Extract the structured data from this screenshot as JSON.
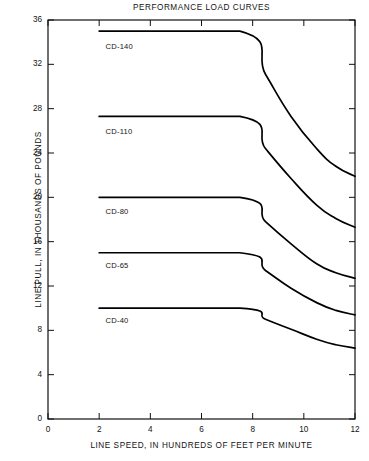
{
  "chart_data": {
    "type": "line",
    "title": "PERFORMANCE LOAD CURVES",
    "xlabel": "LINE SPEED, IN HUNDREDS OF FEET PER MINUTE",
    "ylabel": "LINE PULL, IN THOUSANDS OF POUNDS",
    "xlim": [
      0,
      12
    ],
    "ylim": [
      0,
      36
    ],
    "xticks": [
      0,
      2,
      4,
      6,
      8,
      10,
      12
    ],
    "yticks": [
      0,
      4,
      8,
      12,
      16,
      20,
      24,
      28,
      32,
      36
    ],
    "xtick_labels": [
      "0",
      "2",
      "4",
      "6",
      "8",
      "10",
      "12"
    ],
    "ytick_labels": [
      "0",
      "4",
      "8",
      "12",
      "16",
      "20",
      "24",
      "28",
      "32",
      "36"
    ],
    "grid": false,
    "legend_position": "inline-labels",
    "line_color": "#000000",
    "series": [
      {
        "name": "CD-140",
        "label": "CD-140",
        "label_x": 2.25,
        "label_y": 33.6,
        "x": [
          2.0,
          7.5,
          8.5,
          9.5,
          10.5,
          11.25,
          12.0
        ],
        "y": [
          35.0,
          35.0,
          31.1,
          27.3,
          24.4,
          22.8,
          21.9
        ]
      },
      {
        "name": "CD-110",
        "label": "CD-110",
        "label_x": 2.25,
        "label_y": 25.9,
        "x": [
          2.0,
          7.5,
          8.5,
          9.5,
          10.5,
          11.25,
          12.0
        ],
        "y": [
          27.3,
          27.3,
          24.4,
          21.7,
          19.3,
          18.1,
          17.3
        ]
      },
      {
        "name": "CD-80",
        "label": "CD-80",
        "label_x": 2.25,
        "label_y": 18.7,
        "x": [
          2.0,
          7.5,
          8.5,
          9.5,
          10.5,
          11.25,
          12.0
        ],
        "y": [
          20.0,
          20.0,
          17.8,
          15.8,
          14.0,
          13.2,
          12.7
        ]
      },
      {
        "name": "CD-65",
        "label": "CD-65",
        "label_x": 2.25,
        "label_y": 13.8,
        "x": [
          2.0,
          7.5,
          8.5,
          9.5,
          10.5,
          11.25,
          12.0
        ],
        "y": [
          15.0,
          15.0,
          13.4,
          11.8,
          10.5,
          9.8,
          9.4
        ]
      },
      {
        "name": "CD-40",
        "label": "CD-40",
        "label_x": 2.25,
        "label_y": 8.8,
        "x": [
          2.0,
          7.5,
          8.5,
          9.5,
          10.5,
          11.25,
          12.0
        ],
        "y": [
          10.0,
          10.0,
          9.0,
          8.1,
          7.2,
          6.7,
          6.4
        ]
      }
    ]
  }
}
